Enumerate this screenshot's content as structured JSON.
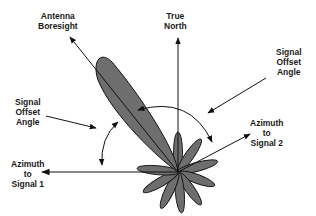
{
  "diagram": {
    "colors": {
      "lobe_fill": "#6e6e6e",
      "stroke": "#111111",
      "background": "#ffffff"
    },
    "labels": {
      "antenna_boresight": [
        "Antenna",
        "Boresight"
      ],
      "true_north": [
        "True",
        "North"
      ],
      "signal_offset_angle_right": [
        "Signal",
        "Offset",
        "Angle"
      ],
      "signal_offset_angle_left": [
        "Signal",
        "Offset",
        "Angle"
      ],
      "azimuth_signal_2": [
        "Azimuth",
        "to",
        "Signal 2"
      ],
      "azimuth_signal_1": [
        "Azimuth",
        "to",
        "Signal 1"
      ]
    },
    "elements": {
      "origin": [
        178,
        172
      ],
      "main_lobe": "Antenna main lobe pointing toward boresight (upper-left, ~30° left of north)",
      "side_lobes": "Rosette of small side lobes around origin",
      "arrows": [
        "Antenna Boresight arrow",
        "True North arrow",
        "Azimuth to Signal 1 arrow (west)",
        "Azimuth to Signal 2 arrow (east-northeast)",
        "Offset arc between boresight and signal 2",
        "Offset arc between boresight and signal 1"
      ]
    }
  }
}
